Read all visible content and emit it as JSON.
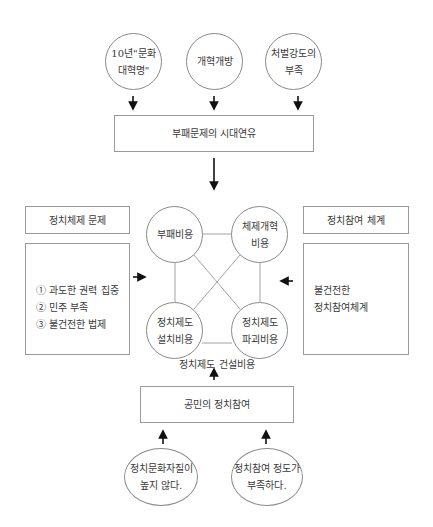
{
  "top_causes": [
    {
      "lines": [
        "10년\"문화",
        "대혁명\""
      ]
    },
    {
      "lines": [
        "개혁개방"
      ]
    },
    {
      "lines": [
        "처벌강도의",
        "부족"
      ]
    }
  ],
  "era_box": {
    "label": "부패문제의 시대연유"
  },
  "left_panel": {
    "title": "정치체제 문제",
    "items": [
      "① 과도한 권력 집중",
      "② 민주 부족",
      "③ 불건전한 법제"
    ]
  },
  "right_panel": {
    "title": "정치참여 체계",
    "lines": [
      "불건전한",
      "정치참여체계"
    ]
  },
  "cost_nodes": [
    {
      "lines": [
        "부패비용"
      ]
    },
    {
      "lines": [
        "체제개혁",
        "비용"
      ]
    },
    {
      "lines": [
        "정치제도",
        "설치비용"
      ]
    },
    {
      "lines": [
        "정치제도",
        "파괴비용"
      ]
    }
  ],
  "cost_group_label": "정치제도 건설비용",
  "participation_box": {
    "label": "공민의 정치참여"
  },
  "bottom_causes": [
    {
      "lines": [
        "정치문화자질이",
        "높지 않다."
      ]
    },
    {
      "lines": [
        "정치참여 정도가",
        "부족하다."
      ]
    }
  ],
  "colors": {
    "line": "#8a8a8a",
    "arrow": "#111111",
    "text": "#3a3a3a"
  }
}
